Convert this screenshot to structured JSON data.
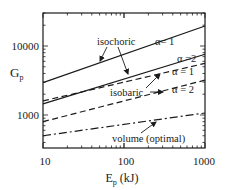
{
  "chart_data": {
    "type": "line",
    "title": "",
    "xlabel": "E",
    "xlabel_sub": "p",
    "xlabel_unit": " (kJ)",
    "ylabel": "G",
    "ylabel_sub": "p",
    "xscale": "log",
    "yscale": "log",
    "xlim": [
      10,
      1000
    ],
    "ylim": [
      320,
      30000
    ],
    "x_ticks": [
      10,
      100,
      1000
    ],
    "x_tick_labels": [
      "10",
      "100",
      "1000"
    ],
    "y_ticks": [
      1000,
      10000
    ],
    "y_tick_labels": [
      "1000",
      "10000"
    ],
    "grid": false,
    "legend": "none (inline annotations)",
    "x": [
      10,
      1000
    ],
    "series": [
      {
        "name": "isochoric, α = 1",
        "group": "isochoric",
        "style": "solid",
        "values": [
          2950,
          19500
        ]
      },
      {
        "name": "isochoric, α = 2",
        "group": "isochoric",
        "style": "solid",
        "values": [
          1450,
          7600
        ]
      },
      {
        "name": "isobaric, α = 1",
        "group": "isobaric",
        "style": "dashed",
        "values": [
          1600,
          5600
        ]
      },
      {
        "name": "isobaric, α = 2",
        "group": "isobaric",
        "style": "dashed",
        "values": [
          800,
          3200
        ]
      },
      {
        "name": "volume (optimal)",
        "group": "volume",
        "style": "dashdot",
        "values": [
          500,
          1070
        ]
      }
    ],
    "annotations": [
      {
        "text": "isochoric",
        "points_to": [
          "isochoric, α = 1",
          "isochoric, α = 2"
        ]
      },
      {
        "text": "isobaric",
        "points_to": [
          "isobaric, α = 1",
          "isobaric, α = 2"
        ]
      },
      {
        "text": "volume (optimal)",
        "points_to": [
          "volume (optimal)"
        ]
      },
      {
        "text": "α= 1",
        "labels": "isochoric, α = 1"
      },
      {
        "text": "α =2",
        "labels": "isochoric, α = 2"
      },
      {
        "text": "α = 1",
        "labels": "isobaric, α = 1"
      },
      {
        "text": "α = 2",
        "labels": "isobaric, α = 2"
      }
    ]
  },
  "labels": {
    "isochoric": "isochoric",
    "isobaric": "isobaric",
    "volume": "volume (optimal)",
    "a1_iso": "α= 1",
    "a2_iso": "α =2",
    "a1_bar": "α = 1",
    "a2_bar": "α = 2"
  }
}
